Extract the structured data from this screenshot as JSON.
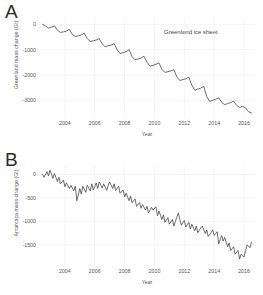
{
  "figure": {
    "background": "#ffffff",
    "line_color": "#3c3c3c",
    "grid_color": "#ededed"
  },
  "panels": [
    {
      "letter": "A",
      "annotation": "Greenland ice sheet",
      "ylabel": "Greenland mass change (Gt)",
      "xlabel": "Year"
    },
    {
      "letter": "B",
      "annotation": "Antarctic ice sheet",
      "ylabel": "Antarctica mass change (Gt)",
      "xlabel": "Year"
    }
  ],
  "chart_data": [
    {
      "type": "line",
      "panel": "A",
      "title": "Greenland ice sheet",
      "xlabel": "Year",
      "ylabel": "Greenland mass change (Gt)",
      "xlim": [
        2002.2,
        2016.8
      ],
      "ylim": [
        -3700,
        250
      ],
      "xticks": [
        2004,
        2006,
        2008,
        2010,
        2012,
        2014,
        2016
      ],
      "yticks": [
        0,
        -1000,
        -2000,
        -3000
      ],
      "grid": true,
      "legend": "none",
      "series": [
        {
          "name": "Greenland mass change",
          "x": [
            2002.5,
            2002.7,
            2002.9,
            2003.1,
            2003.3,
            2003.5,
            2003.7,
            2003.9,
            2004.1,
            2004.3,
            2004.5,
            2004.7,
            2004.9,
            2005.1,
            2005.3,
            2005.5,
            2005.7,
            2005.9,
            2006.1,
            2006.3,
            2006.5,
            2006.7,
            2006.9,
            2007.1,
            2007.3,
            2007.5,
            2007.7,
            2007.9,
            2008.1,
            2008.3,
            2008.5,
            2008.7,
            2008.9,
            2009.1,
            2009.3,
            2009.5,
            2009.7,
            2009.9,
            2010.1,
            2010.3,
            2010.5,
            2010.7,
            2010.9,
            2011.1,
            2011.3,
            2011.5,
            2011.7,
            2011.9,
            2012.1,
            2012.3,
            2012.5,
            2012.7,
            2012.9,
            2013.1,
            2013.3,
            2013.5,
            2013.7,
            2013.9,
            2014.1,
            2014.3,
            2014.5,
            2014.7,
            2014.9,
            2015.1,
            2015.3,
            2015.5,
            2015.7,
            2015.9,
            2016.1,
            2016.3,
            2016.5
          ],
          "y": [
            0,
            -60,
            -150,
            -110,
            -60,
            -230,
            -320,
            -300,
            -270,
            -200,
            -400,
            -480,
            -450,
            -420,
            -350,
            -560,
            -680,
            -650,
            -620,
            -560,
            -780,
            -880,
            -850,
            -820,
            -760,
            -1000,
            -1150,
            -1120,
            -1080,
            -1000,
            -1280,
            -1400,
            -1370,
            -1330,
            -1260,
            -1500,
            -1650,
            -1620,
            -1580,
            -1520,
            -1780,
            -1900,
            -1870,
            -1840,
            -1790,
            -2080,
            -2220,
            -2180,
            -2150,
            -2080,
            -2400,
            -2600,
            -2560,
            -2520,
            -2450,
            -2850,
            -3050,
            -3000,
            -2960,
            -2900,
            -3080,
            -3170,
            -3130,
            -3090,
            -3030,
            -3200,
            -3280,
            -3240,
            -3300,
            -3450,
            -3500
          ]
        }
      ]
    },
    {
      "type": "line",
      "panel": "B",
      "title": "Antarctic ice sheet",
      "xlabel": "Year",
      "ylabel": "Antarctica mass change (Gt)",
      "xlim": [
        2002.2,
        2016.8
      ],
      "ylim": [
        -1950,
        180
      ],
      "xticks": [
        2004,
        2006,
        2008,
        2010,
        2012,
        2014,
        2016
      ],
      "yticks": [
        0,
        -500,
        -1000,
        -1500
      ],
      "grid": true,
      "legend": "none",
      "series": [
        {
          "name": "Antarctica mass change",
          "x": [
            2002.5,
            2002.6,
            2002.8,
            2002.9,
            2003.0,
            2003.2,
            2003.3,
            2003.5,
            2003.6,
            2003.7,
            2003.9,
            2004.0,
            2004.1,
            2004.3,
            2004.4,
            2004.6,
            2004.7,
            2004.8,
            2005.0,
            2005.1,
            2005.2,
            2005.4,
            2005.5,
            2005.7,
            2005.8,
            2005.9,
            2006.1,
            2006.2,
            2006.3,
            2006.5,
            2006.6,
            2006.8,
            2006.9,
            2007.0,
            2007.2,
            2007.3,
            2007.4,
            2007.6,
            2007.7,
            2007.9,
            2008.0,
            2008.1,
            2008.3,
            2008.4,
            2008.5,
            2008.7,
            2008.8,
            2009.0,
            2009.1,
            2009.2,
            2009.4,
            2009.5,
            2009.6,
            2009.8,
            2009.9,
            2010.1,
            2010.2,
            2010.3,
            2010.5,
            2010.6,
            2010.7,
            2010.9,
            2011.0,
            2011.2,
            2011.3,
            2011.4,
            2011.6,
            2011.7,
            2011.8,
            2012.0,
            2012.1,
            2012.3,
            2012.4,
            2012.5,
            2012.7,
            2012.8,
            2012.9,
            2013.1,
            2013.2,
            2013.4,
            2013.5,
            2013.6,
            2013.8,
            2013.9,
            2014.0,
            2014.2,
            2014.3,
            2014.5,
            2014.6,
            2014.7,
            2014.9,
            2015.0,
            2015.1,
            2015.3,
            2015.4,
            2015.6,
            2015.7,
            2015.8,
            2016.0,
            2016.1,
            2016.2,
            2016.4,
            2016.5
          ],
          "y": [
            0,
            -60,
            60,
            -30,
            90,
            -80,
            20,
            -150,
            -60,
            -200,
            -120,
            -260,
            -180,
            -300,
            -230,
            -350,
            -250,
            -560,
            -300,
            -420,
            -250,
            -380,
            -230,
            -350,
            -200,
            -330,
            -180,
            -300,
            -160,
            -290,
            -200,
            -340,
            -230,
            -160,
            -300,
            -200,
            -340,
            -250,
            -400,
            -330,
            -480,
            -400,
            -560,
            -460,
            -600,
            -520,
            -680,
            -600,
            -720,
            -640,
            -760,
            -680,
            -820,
            -700,
            -760,
            -690,
            -880,
            -780,
            -960,
            -860,
            -1020,
            -920,
            -1060,
            -960,
            -1100,
            -1000,
            -820,
            -960,
            -1080,
            -980,
            -1120,
            -1020,
            -1160,
            -1060,
            -1200,
            -1100,
            -1240,
            -1140,
            -1100,
            -1260,
            -1180,
            -1320,
            -1240,
            -1180,
            -1300,
            -1220,
            -1480,
            -1300,
            -1420,
            -1340,
            -1540,
            -1460,
            -1620,
            -1540,
            -1700,
            -1620,
            -1800,
            -1700,
            -1760,
            -1620,
            -1500,
            -1560,
            -1440
          ]
        }
      ]
    }
  ]
}
